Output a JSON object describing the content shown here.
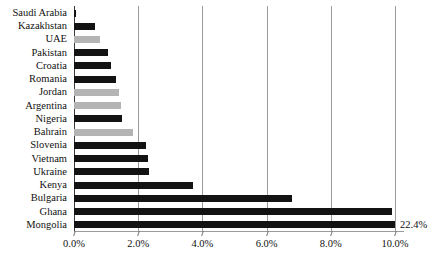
{
  "chart_data": {
    "type": "bar",
    "orientation": "horizontal",
    "title": "",
    "xlabel": "",
    "ylabel": "",
    "xlim": [
      0.0,
      10.0
    ],
    "xtick_labels": [
      "0.0%",
      "2.0%",
      "4.0%",
      "6.0%",
      "8.0%",
      "10.0%"
    ],
    "xtick_values": [
      0.0,
      2.0,
      4.0,
      6.0,
      8.0,
      10.0
    ],
    "grid": true,
    "legend": "none",
    "categories": [
      "Saudi Arabia",
      "Kazakhstan",
      "UAE",
      "Pakistan",
      "Croatia",
      "Romania",
      "Jordan",
      "Argentina",
      "Nigeria",
      "Bahrain",
      "Slovenia",
      "Vietnam",
      "Ukraine",
      "Kenya",
      "Bulgaria",
      "Ghana",
      "Mongolia"
    ],
    "values": [
      0.05,
      0.65,
      0.8,
      1.05,
      1.15,
      1.3,
      1.4,
      1.45,
      1.5,
      1.85,
      2.25,
      2.3,
      2.35,
      3.7,
      6.8,
      9.9,
      22.4
    ],
    "bar_colors": [
      "#131313",
      "#131313",
      "#b4b4b4",
      "#131313",
      "#131313",
      "#131313",
      "#b4b4b4",
      "#b4b4b4",
      "#131313",
      "#b4b4b4",
      "#131313",
      "#131313",
      "#131313",
      "#131313",
      "#131313",
      "#131313",
      "#131313"
    ],
    "annotations": [
      {
        "text": "22.4%",
        "category": "Mongolia",
        "note": "value label for bar clipped at axis maximum"
      }
    ],
    "colors": {
      "bar_dark": "#131313",
      "bar_light": "#b4b4b4",
      "gridline": "#9a9a9a",
      "axis": "#3a3a3a",
      "text": "#111111",
      "background": "#ffffff"
    }
  }
}
